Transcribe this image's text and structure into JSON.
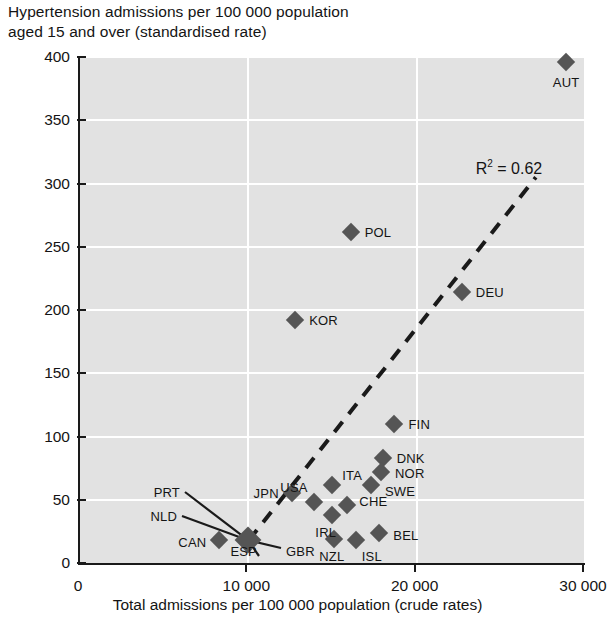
{
  "chart_data": {
    "type": "scatter",
    "title": "Hypertension admissions per 100 000 population\naged 15 and over (standardised rate)",
    "xlabel": "Total admissions per 100 000 population (crude rates)",
    "ylabel": "",
    "xlim": [
      0,
      30000
    ],
    "ylim": [
      0,
      400
    ],
    "xticks": [
      0,
      10000,
      20000,
      30000
    ],
    "xticklabels": [
      "0",
      "10 000",
      "20 000",
      "30 000"
    ],
    "yticks": [
      0,
      50,
      100,
      150,
      200,
      250,
      300,
      350,
      400
    ],
    "yticklabels": [
      "0",
      "50",
      "100",
      "150",
      "200",
      "250",
      "300",
      "350",
      "400"
    ],
    "grid": "both",
    "legend": "none",
    "annotations": [
      {
        "text": "R² = 0.62",
        "x": 25600,
        "y": 312
      }
    ],
    "trendline": {
      "style": "dashed",
      "x0": 10150,
      "y0": 18,
      "x1": 27200,
      "y1": 305
    },
    "points": [
      {
        "label": "AUT",
        "x": 29000,
        "y": 396,
        "label_pos": "below"
      },
      {
        "label": "POL",
        "x": 16200,
        "y": 262,
        "label_pos": "right"
      },
      {
        "label": "DEU",
        "x": 22800,
        "y": 214,
        "label_pos": "right"
      },
      {
        "label": "KOR",
        "x": 12900,
        "y": 192,
        "label_pos": "right"
      },
      {
        "label": "FIN",
        "x": 18800,
        "y": 110,
        "label_pos": "right"
      },
      {
        "label": "DNK",
        "x": 18100,
        "y": 83,
        "label_pos": "right"
      },
      {
        "label": "NOR",
        "x": 18000,
        "y": 72,
        "label_pos": "right"
      },
      {
        "label": "SWE",
        "x": 17400,
        "y": 62,
        "label_pos": "right"
      },
      {
        "label": "ITA",
        "x": 15100,
        "y": 62,
        "label_pos": "right"
      },
      {
        "label": "CHE",
        "x": 16000,
        "y": 46,
        "label_pos": "right"
      },
      {
        "label": "JPN",
        "x": 12700,
        "y": 55,
        "label_pos": "left"
      },
      {
        "label": "USA",
        "x": 14000,
        "y": 48,
        "label_pos": "above-left"
      },
      {
        "label": "IRL",
        "x": 15100,
        "y": 38,
        "label_pos": "below"
      },
      {
        "label": "BEL",
        "x": 17900,
        "y": 24,
        "label_pos": "right"
      },
      {
        "label": "ISL",
        "x": 16500,
        "y": 18,
        "label_pos": "below-right"
      },
      {
        "label": "NZL",
        "x": 15200,
        "y": 19,
        "label_pos": "below"
      },
      {
        "label": "CAN",
        "x": 8400,
        "y": 18,
        "label_pos": "left"
      },
      {
        "label": "GBR",
        "x": 10100,
        "y": 18,
        "label_pos": "leader"
      },
      {
        "label": "ESP",
        "x": 10100,
        "y": 18,
        "label_pos": "leader"
      },
      {
        "label": "NLD",
        "x": 10100,
        "y": 18,
        "label_pos": "leader"
      },
      {
        "label": "PRT",
        "x": 10100,
        "y": 18,
        "label_pos": "leader"
      }
    ],
    "cluster_note": "PRT, NLD, ESP, GBR share one overlapping marker near 10 000 / 18, connected by leader lines"
  },
  "colors": {
    "plot_background": "#e2e2e2",
    "gridline": "#ffffff",
    "marker": "#555555",
    "axis": "#1a1a1a",
    "text": "#141414"
  }
}
